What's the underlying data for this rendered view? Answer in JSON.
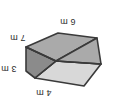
{
  "figure": {
    "kind": "rectangular-prism",
    "orientation": "rotated-180",
    "background_color": "#ffffff",
    "faces": {
      "top_face_color": "#aaaaaa",
      "left_face_color": "#8b8b8b",
      "front_face_color": "#d8d8d8"
    },
    "edge_color": "#3a3a3a",
    "labels": {
      "length": "6 m",
      "depth": "7 m",
      "height": "3 m",
      "width": "4 m"
    }
  }
}
